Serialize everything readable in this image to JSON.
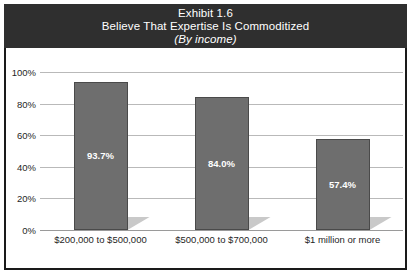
{
  "title": {
    "line1": "Exhibit 1.6",
    "line2": "Believe That Expertise Is Commoditized",
    "line3": "(By income)"
  },
  "chart_data": {
    "type": "bar",
    "title": "Exhibit 1.6 Believe That Expertise Is Commoditized (By income)",
    "subtitle": "(By income)",
    "xlabel": "",
    "ylabel": "",
    "categories": [
      "$200,000 to $500,000",
      "$500,000 to $700,000",
      "$1 million or more"
    ],
    "values": [
      93.7,
      84.0,
      57.4
    ],
    "value_labels": [
      "93.7%",
      "84.0%",
      "57.4%"
    ],
    "ylim": [
      0,
      100
    ],
    "ytick_labels": [
      "0%",
      "20%",
      "40%",
      "60%",
      "80%",
      "100%"
    ],
    "ytick_values": [
      0,
      20,
      40,
      60,
      80,
      100
    ],
    "grid": true,
    "legend": "none",
    "colors": {
      "bar_fill": "#6e6e6e",
      "bar_outline": "#4a4a4a",
      "bar_shadow": "#c9c9c9",
      "title_band": "#2f2f2f",
      "title_text": "#ffffff",
      "gridline": "#b9b9b9",
      "frame": "#1a1a1a",
      "background": "#ffffff",
      "value_text": "#ffffff",
      "axis_text": "#1f1f1f"
    }
  }
}
